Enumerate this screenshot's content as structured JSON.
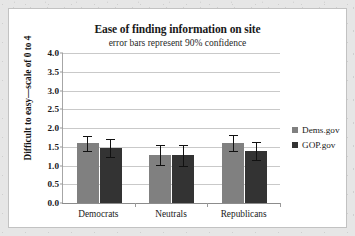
{
  "chart_data": {
    "type": "bar",
    "title": "Ease of finding information on site",
    "subtitle": "error bars represent 90% confidence",
    "xlabel": "",
    "ylabel": "Difficult to easy—scale of 0 to 4",
    "ylim": [
      0,
      4
    ],
    "ytick_step": 0.5,
    "ytick_labels": [
      "4.0",
      "3.5",
      "3.0",
      "2.5",
      "2.0",
      "1.5",
      "1.0",
      "0.5",
      "0.0"
    ],
    "ytick_values": [
      4.0,
      3.5,
      3.0,
      2.5,
      2.0,
      1.5,
      1.0,
      0.5,
      0.0
    ],
    "grid": true,
    "legend_position": "right",
    "categories": [
      "Democrats",
      "Neutrals",
      "Republicans"
    ],
    "series": [
      {
        "name": "Dems.gov",
        "color": "#808080",
        "values": [
          1.59,
          1.29,
          1.6
        ],
        "error_low": [
          0.21,
          0.27,
          0.21
        ],
        "error_high": [
          0.21,
          0.27,
          0.21
        ]
      },
      {
        "name": "GOP.gov",
        "color": "#333333",
        "values": [
          1.47,
          1.28,
          1.39
        ],
        "error_low": [
          0.24,
          0.28,
          0.23
        ],
        "error_high": [
          0.24,
          0.28,
          0.23
        ]
      }
    ]
  },
  "colors": {
    "series_1": "#808080",
    "series_2": "#333333",
    "gridline": "#c9c9c9",
    "axis": "#8c8c8c",
    "text": "#1a1a1a",
    "card_background": "#ffffff",
    "page_background": "#e6e6e6"
  }
}
